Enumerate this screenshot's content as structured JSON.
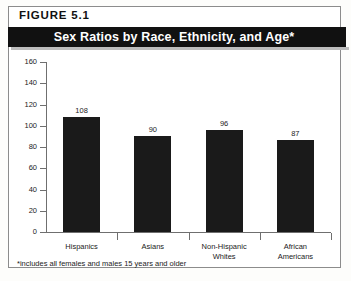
{
  "figure": {
    "label": "FIGURE  5.1",
    "title": "Sex Ratios by Race, Ethnicity, and Age*",
    "footnote": "*includes all females and males 15 years and older"
  },
  "colors": {
    "bar": "#1a1a1a",
    "banner_background": "#111111",
    "banner_text": "#ffffff",
    "axis": "#6f6f6f",
    "frame": "#8c8c8c"
  },
  "chart_data": {
    "type": "bar",
    "title": "Sex Ratios by Race, Ethnicity, and Age*",
    "xlabel": "",
    "ylabel": "",
    "categories": [
      "Hispanics",
      "Asians",
      "Non-Hispanic Whites",
      "African Americans"
    ],
    "category_lines": [
      [
        "Hispanics"
      ],
      [
        "Asians"
      ],
      [
        "Non-Hispanic",
        "Whites"
      ],
      [
        "African",
        "Americans"
      ]
    ],
    "values": [
      108,
      90,
      96,
      87
    ],
    "ylim": [
      0,
      160
    ],
    "yticks": [
      0,
      20,
      40,
      60,
      80,
      100,
      120,
      140,
      160
    ],
    "ytick_labels": [
      "0",
      "20",
      "40",
      "60",
      "80",
      "100",
      "120",
      "140",
      "160"
    ],
    "grid": false,
    "legend": "none",
    "annotations": [
      "*includes all females and males 15 years and older"
    ]
  }
}
